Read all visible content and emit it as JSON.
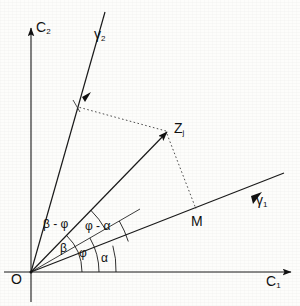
{
  "figure": {
    "background_color": "#fdfdfb",
    "ink_color": "#111111",
    "origin_label": "O",
    "axes": [
      {
        "name": "horizontal-axis",
        "label": "C",
        "subscript": "1",
        "angle_deg": 0
      },
      {
        "name": "vertical-axis",
        "label": "C",
        "subscript": "2",
        "angle_deg": 90
      }
    ],
    "rotated_axes": [
      {
        "name": "gamma-1-axis",
        "label": "γ",
        "subscript": "1",
        "angle_deg": 18
      },
      {
        "name": "gamma-2-axis",
        "label": "γ",
        "subscript": "2",
        "angle_deg": 72
      }
    ],
    "points": [
      {
        "name": "origin",
        "label": "O",
        "x": 31,
        "y": 272
      },
      {
        "name": "point-zj",
        "label": "Z",
        "subscript": "j",
        "x": 166,
        "y": 131
      },
      {
        "name": "point-m",
        "label": "M",
        "x": 196,
        "y": 209
      }
    ],
    "vectors": [
      {
        "name": "vector-o-zj",
        "from": "O",
        "to": "Z_j",
        "angle_deg": 46
      }
    ],
    "projection_lines": [
      {
        "name": "projection-to-gamma2",
        "from": "Z_j",
        "to": "gamma-2-axis",
        "style": "dotted"
      },
      {
        "name": "projection-to-gamma1",
        "from": "Z_j",
        "to": "M",
        "style": "dotted"
      }
    ],
    "angles": [
      {
        "name": "angle-alpha",
        "label": "α",
        "between": [
          "C1",
          "gamma-1"
        ],
        "value_deg": 18
      },
      {
        "name": "angle-phi",
        "label": "φ",
        "between": [
          "C1",
          "OZj-ref"
        ],
        "value_deg": 30
      },
      {
        "name": "angle-beta",
        "label": "β",
        "between": [
          "C1",
          "OZj"
        ],
        "value_deg": 46
      },
      {
        "name": "angle-phi-alpha",
        "label": "φ - α",
        "between": [
          "gamma-1",
          "phi-ray"
        ],
        "value_deg": 12
      },
      {
        "name": "angle-beta-phi",
        "label": "β - φ",
        "between": [
          "phi-ray",
          "OZj"
        ],
        "value_deg": 16
      }
    ]
  },
  "labels": {
    "c1": "C",
    "c1_sub": "1",
    "c2": "C",
    "c2_sub": "2",
    "gamma1": "γ",
    "gamma1_sub": "1",
    "gamma2": "γ",
    "gamma2_sub": "2",
    "origin": "O",
    "zj": "Z",
    "zj_sub": "j",
    "m": "M",
    "alpha": "α",
    "phi": "φ",
    "beta": "β",
    "phi_minus_alpha": "φ - α",
    "beta_minus_phi": "β - φ"
  }
}
